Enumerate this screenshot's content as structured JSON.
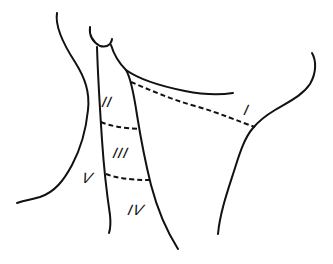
{
  "diagram": {
    "stroke_color": "#111111",
    "background_color": "#ffffff",
    "labels": {
      "level_1": "I",
      "level_2": "II",
      "level_3": "III",
      "level_4": "IV",
      "level_5": "V"
    }
  }
}
